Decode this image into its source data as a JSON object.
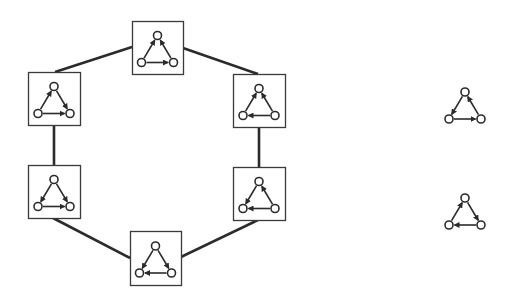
{
  "diagram": {
    "colors": {
      "stroke": "#2b2b2b",
      "background": "#ffffff",
      "box_stroke": "#3a3a3a"
    },
    "ring": {
      "boxes": [
        {
          "id": "top",
          "x": 132,
          "y": 21,
          "w": 51,
          "h": 53,
          "edges": [
            [
              "bl",
              "top"
            ],
            [
              "br",
              "top"
            ],
            [
              "bl",
              "br"
            ]
          ]
        },
        {
          "id": "right-top",
          "x": 233,
          "y": 74,
          "w": 52,
          "h": 53,
          "edges": [
            [
              "bl",
              "top"
            ],
            [
              "br",
              "top"
            ],
            [
              "br",
              "bl"
            ]
          ]
        },
        {
          "id": "right-bottom",
          "x": 233,
          "y": 167,
          "w": 52,
          "h": 53,
          "edges": [
            [
              "top",
              "bl"
            ],
            [
              "br",
              "top"
            ],
            [
              "br",
              "bl"
            ]
          ]
        },
        {
          "id": "bottom",
          "x": 130,
          "y": 231,
          "w": 51,
          "h": 54,
          "edges": [
            [
              "top",
              "bl"
            ],
            [
              "top",
              "br"
            ],
            [
              "br",
              "bl"
            ]
          ]
        },
        {
          "id": "left-bottom",
          "x": 28,
          "y": 165,
          "w": 52,
          "h": 53,
          "edges": [
            [
              "top",
              "bl"
            ],
            [
              "top",
              "br"
            ],
            [
              "bl",
              "br"
            ]
          ]
        },
        {
          "id": "left-top",
          "x": 28,
          "y": 72,
          "w": 52,
          "h": 53,
          "edges": [
            [
              "bl",
              "top"
            ],
            [
              "top",
              "br"
            ],
            [
              "bl",
              "br"
            ]
          ]
        }
      ],
      "connections": [
        [
          132,
          47,
          55,
          72
        ],
        [
          183,
          48,
          258,
          74
        ],
        [
          259,
          127,
          259,
          167
        ],
        [
          258,
          220,
          181,
          257
        ],
        [
          130,
          258,
          53,
          218
        ],
        [
          54,
          165,
          54,
          125
        ]
      ]
    },
    "standalone": [
      {
        "id": "cycle-clockwise",
        "cx": 465,
        "cy": 106,
        "edges": [
          [
            "top",
            "bl"
          ],
          [
            "bl",
            "br"
          ],
          [
            "br",
            "top"
          ]
        ]
      },
      {
        "id": "cycle-counterclockwise",
        "cx": 465,
        "cy": 212,
        "edges": [
          [
            "bl",
            "top"
          ],
          [
            "top",
            "br"
          ],
          [
            "br",
            "bl"
          ]
        ]
      }
    ]
  }
}
